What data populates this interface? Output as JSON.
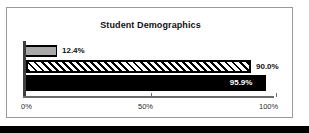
{
  "chart_data": {
    "type": "bar",
    "orientation": "horizontal",
    "title": "Student Demographics",
    "xlabel": "",
    "ylabel": "",
    "categories": [
      "series-1",
      "series-2",
      "series-3"
    ],
    "values": [
      12.4,
      90.0,
      95.9
    ],
    "data_labels": [
      "12.4%",
      "90.0%",
      "95.9%"
    ],
    "label_placement": [
      "outside-end",
      "outside-end",
      "inside-end"
    ],
    "bar_styles": [
      "solid-gray",
      "diagonal-hatch",
      "solid-black"
    ],
    "bar_colors": [
      "#a8a8a8",
      "#ffffff",
      "#000000"
    ],
    "xlim": [
      0,
      100
    ],
    "xticks": [
      0,
      50,
      100
    ],
    "xtick_labels": [
      "0%",
      "50%",
      "100%"
    ],
    "grid": false,
    "legend": false
  },
  "frame": {
    "border_color": "#9a9a9a",
    "background": "#ffffff"
  },
  "bottom_bar": {
    "color": "#000000"
  }
}
